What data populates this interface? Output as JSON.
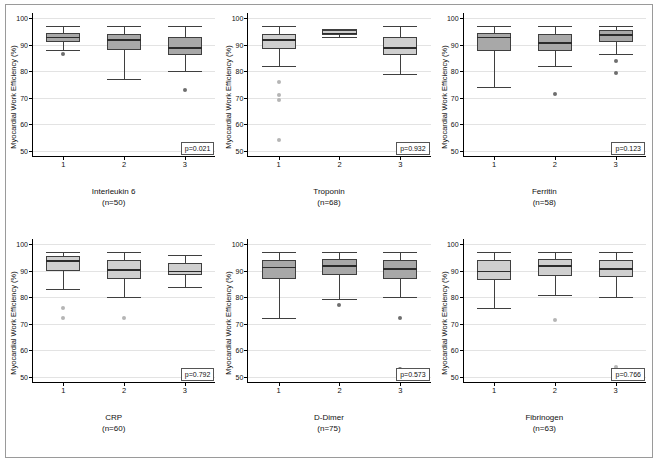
{
  "figure": {
    "ylabel": "Myocardial Work Efficiency (%)",
    "yticks": [
      50,
      60,
      70,
      80,
      90,
      100
    ],
    "ylim": [
      48,
      102
    ],
    "xticks": [
      "1",
      "2",
      "3"
    ],
    "box_fill_dark": "#a8a8a8",
    "box_fill_light": "#cfcfcf",
    "outlier_color_dark": "#6e6e6e",
    "outlier_color_light": "#b5b5b5"
  },
  "chart_data": [
    {
      "type": "box",
      "id": "interleukin-6",
      "title": "Interleukin 6",
      "subtitle": "(n=50)",
      "ylabel": "Myocardial Work Efficiency (%)",
      "xlabel": "",
      "ylim": [
        48,
        102
      ],
      "yticks": [
        50,
        60,
        70,
        80,
        90,
        100
      ],
      "categories": [
        "1",
        "2",
        "3"
      ],
      "pvalue": "p=0.021",
      "boxes": [
        {
          "category": "1",
          "whisker_low": 88,
          "q1": 91,
          "median": 93,
          "q3": 94.5,
          "whisker_high": 97,
          "outliers": [
            86.5
          ]
        },
        {
          "category": "2",
          "whisker_low": 77,
          "q1": 88,
          "median": 92,
          "q3": 94,
          "whisker_high": 97,
          "outliers": []
        },
        {
          "category": "3",
          "whisker_low": 80,
          "q1": 86,
          "median": 89,
          "q3": 93,
          "whisker_high": 97,
          "outliers": [
            73
          ]
        }
      ]
    },
    {
      "type": "box",
      "id": "troponin",
      "title": "Troponin",
      "subtitle": "(n=68)",
      "ylabel": "Myocardial Work Efficiency (%)",
      "xlabel": "",
      "ylim": [
        48,
        102
      ],
      "yticks": [
        50,
        60,
        70,
        80,
        90,
        100
      ],
      "categories": [
        "1",
        "2",
        "3"
      ],
      "pvalue": "p=0.932",
      "boxes": [
        {
          "category": "1",
          "whisker_low": 82,
          "q1": 88.5,
          "median": 92,
          "q3": 94,
          "whisker_high": 97,
          "outliers": [
            76,
            71,
            69,
            54
          ]
        },
        {
          "category": "2",
          "whisker_low": 93,
          "q1": 93.5,
          "median": 94.5,
          "q3": 95.5,
          "whisker_high": 96,
          "outliers": []
        },
        {
          "category": "3",
          "whisker_low": 79,
          "q1": 86,
          "median": 89,
          "q3": 93,
          "whisker_high": 97,
          "outliers": []
        }
      ]
    },
    {
      "type": "box",
      "id": "ferritin",
      "title": "Ferritin",
      "subtitle": "(n=58)",
      "ylabel": "Myocardial Work Efficiency (%)",
      "xlabel": "",
      "ylim": [
        48,
        102
      ],
      "yticks": [
        50,
        60,
        70,
        80,
        90,
        100
      ],
      "categories": [
        "1",
        "2",
        "3"
      ],
      "pvalue": "p=0.123",
      "boxes": [
        {
          "category": "1",
          "whisker_low": 74,
          "q1": 87.5,
          "median": 93,
          "q3": 94.5,
          "whisker_high": 97,
          "outliers": []
        },
        {
          "category": "2",
          "whisker_low": 82,
          "q1": 87.5,
          "median": 91,
          "q3": 94,
          "whisker_high": 97,
          "outliers": [
            71.5
          ]
        },
        {
          "category": "3",
          "whisker_low": 86.5,
          "q1": 91,
          "median": 94,
          "q3": 95.5,
          "whisker_high": 97,
          "outliers": [
            84,
            79.5
          ]
        }
      ]
    },
    {
      "type": "box",
      "id": "crp",
      "title": "CRP",
      "subtitle": "(n=60)",
      "ylabel": "Myocardial Work Efficiency (%)",
      "xlabel": "",
      "ylim": [
        48,
        102
      ],
      "yticks": [
        50,
        60,
        70,
        80,
        90,
        100
      ],
      "categories": [
        "1",
        "2",
        "3"
      ],
      "pvalue": "p=0.792",
      "boxes": [
        {
          "category": "1",
          "whisker_low": 83,
          "q1": 90,
          "median": 94,
          "q3": 95.5,
          "whisker_high": 97,
          "outliers": [
            76,
            72
          ]
        },
        {
          "category": "2",
          "whisker_low": 80,
          "q1": 87,
          "median": 90.5,
          "q3": 94,
          "whisker_high": 97,
          "outliers": [
            72
          ]
        },
        {
          "category": "3",
          "whisker_low": 84,
          "q1": 88.5,
          "median": 90,
          "q3": 93,
          "whisker_high": 96,
          "outliers": []
        }
      ]
    },
    {
      "type": "box",
      "id": "d-dimer",
      "title": "D-Dimer",
      "subtitle": "(n=75)",
      "ylabel": "Myocardial Work Efficiency (%)",
      "xlabel": "",
      "ylim": [
        48,
        102
      ],
      "yticks": [
        50,
        60,
        70,
        80,
        90,
        100
      ],
      "categories": [
        "1",
        "2",
        "3"
      ],
      "pvalue": "p=0.573",
      "boxes": [
        {
          "category": "1",
          "whisker_low": 72,
          "q1": 87,
          "median": 91.5,
          "q3": 94,
          "whisker_high": 97,
          "outliers": []
        },
        {
          "category": "2",
          "whisker_low": 79.5,
          "q1": 88.5,
          "median": 92,
          "q3": 94.5,
          "whisker_high": 97,
          "outliers": [
            77
          ]
        },
        {
          "category": "3",
          "whisker_low": 80,
          "q1": 87,
          "median": 91,
          "q3": 94,
          "whisker_high": 97,
          "outliers": [
            72,
            53
          ]
        }
      ]
    },
    {
      "type": "box",
      "id": "fibrinogen",
      "title": "Fibrinogen",
      "subtitle": "(n=63)",
      "ylabel": "Myocardial Work Efficiency (%)",
      "xlabel": "",
      "ylim": [
        48,
        102
      ],
      "yticks": [
        50,
        60,
        70,
        80,
        90,
        100
      ],
      "categories": [
        "1",
        "2",
        "3"
      ],
      "pvalue": "p=0.766",
      "boxes": [
        {
          "category": "1",
          "whisker_low": 76,
          "q1": 86.5,
          "median": 90,
          "q3": 94,
          "whisker_high": 97,
          "outliers": []
        },
        {
          "category": "2",
          "whisker_low": 81,
          "q1": 88,
          "median": 92,
          "q3": 94.5,
          "whisker_high": 97,
          "outliers": [
            71.5
          ]
        },
        {
          "category": "3",
          "whisker_low": 80,
          "q1": 87.5,
          "median": 91,
          "q3": 94,
          "whisker_high": 97,
          "outliers": [
            53.5
          ]
        }
      ]
    }
  ]
}
